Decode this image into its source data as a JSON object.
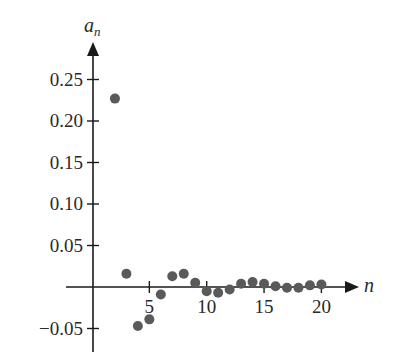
{
  "chart_data": {
    "type": "scatter",
    "title": "",
    "xlabel": "n",
    "ylabel": "a_n",
    "ylabel_main": "a",
    "ylabel_sub": "n",
    "xlim": [
      0,
      23
    ],
    "ylim": [
      -0.065,
      0.3
    ],
    "x_ticks": [
      5,
      10,
      15,
      20
    ],
    "x_tick_labels": [
      "5",
      "10",
      "15",
      "20"
    ],
    "y_ticks": [
      0.25,
      0.2,
      0.15,
      0.1,
      0.05,
      -0.05
    ],
    "y_tick_labels": [
      "0.25",
      "0.20",
      "0.15",
      "0.10",
      "0.05",
      "−0.05"
    ],
    "grid": false,
    "legend": null,
    "point_color": "#5a5a5a",
    "axis_color": "#1a1a1a",
    "x": [
      2,
      3,
      4,
      5,
      6,
      7,
      8,
      9,
      10,
      11,
      12,
      13,
      14,
      15,
      16,
      17,
      18,
      19,
      20
    ],
    "y": [
      0.227,
      0.016,
      -0.047,
      -0.039,
      -0.009,
      0.013,
      0.016,
      0.005,
      -0.005,
      -0.007,
      -0.003,
      0.004,
      0.006,
      0.004,
      0.001,
      -0.001,
      -0.001,
      0.002,
      0.003
    ]
  }
}
